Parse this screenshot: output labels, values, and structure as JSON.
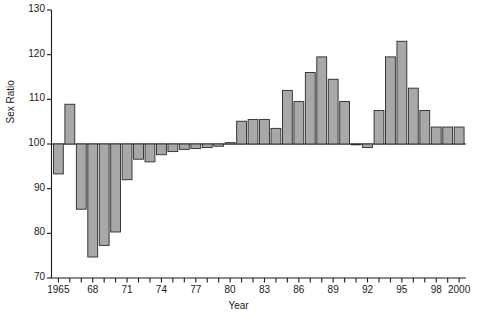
{
  "chart_data": {
    "type": "bar",
    "title": "",
    "subtitle": "",
    "xlabel": "Year",
    "ylabel": "Sex Ratio",
    "ylim": [
      70,
      130
    ],
    "xlim": [
      1964.4,
      2000.6
    ],
    "grid": false,
    "legend": null,
    "baseline": 100,
    "ytick_labels": [
      "130",
      "120",
      "110",
      "100",
      "90",
      "80",
      "70"
    ],
    "ytick_values": [
      130,
      120,
      110,
      100,
      90,
      80,
      70
    ],
    "xtick_labels": [
      "1965",
      "68",
      "71",
      "74",
      "77",
      "80",
      "83",
      "86",
      "89",
      "92",
      "95",
      "98",
      "2000"
    ],
    "xtick_values": [
      1965,
      1968,
      1971,
      1974,
      1977,
      1980,
      1983,
      1986,
      1989,
      1992,
      1995,
      1998,
      2000
    ],
    "xtick_minor_values": [
      1966,
      1967,
      1969,
      1970,
      1972,
      1973,
      1975,
      1976,
      1978,
      1979,
      1981,
      1982,
      1984,
      1985,
      1987,
      1988,
      1990,
      1991,
      1993,
      1994,
      1996,
      1997,
      1999
    ],
    "categories": [
      1965,
      1966,
      1967,
      1968,
      1969,
      1970,
      1971,
      1972,
      1973,
      1974,
      1975,
      1976,
      1977,
      1978,
      1979,
      1980,
      1981,
      1982,
      1983,
      1984,
      1985,
      1986,
      1987,
      1988,
      1989,
      1990,
      1991,
      1992,
      1993,
      1994,
      1995,
      1996,
      1997,
      1998,
      1999,
      2000
    ],
    "values": [
      93.3,
      108.9,
      85.4,
      74.7,
      77.3,
      80.3,
      92.0,
      96.6,
      96.0,
      97.6,
      98.3,
      98.8,
      99.0,
      99.2,
      99.5,
      100.3,
      105.1,
      105.5,
      105.5,
      103.5,
      112.0,
      109.5,
      116.0,
      119.5,
      114.5,
      109.5,
      100.0,
      99.2,
      107.5,
      119.5,
      123.0,
      112.5,
      107.5,
      103.8,
      103.8,
      103.8
    ],
    "bar_color": "#a8a8a8",
    "bar_edge_color": "#2a2a2a",
    "axis_color": "#1a1a1a",
    "background_color": "#ffffff"
  }
}
